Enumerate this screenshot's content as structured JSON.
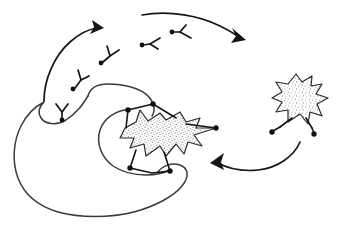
{
  "figure": {
    "background_color": "#ffffff",
    "ink_color": "#161616",
    "outline_color": "#3a3a3a",
    "stipple_color": "#8a8a8a",
    "width": 341,
    "height": 231
  },
  "shapes": {
    "amoeba": {
      "name": "large-amoeba-outline",
      "description": "large rounded closed outline with a notch at the top, occupying lower left",
      "stroke_color": "#3a3a3a"
    },
    "inner_arc": {
      "name": "inner-arc",
      "description": "curved arc inside the amoeba enclosing the central blob"
    },
    "center_blob": {
      "name": "center-stippled-blob",
      "description": "stippled star-shaped body with spikes, centre of image",
      "fill": "stipple"
    },
    "right_blob": {
      "name": "right-stippled-blob",
      "description": "stippled star-shaped body with spikes, right side of image",
      "fill": "stipple"
    }
  },
  "nodes": {
    "center": [
      {
        "name": "node-center-upper-left",
        "x": 128,
        "y": 110
      },
      {
        "name": "node-center-upper-right",
        "x": 153,
        "y": 104
      },
      {
        "name": "node-center-right-tip",
        "x": 216,
        "y": 128
      },
      {
        "name": "node-center-lower-left",
        "x": 130,
        "y": 168
      },
      {
        "name": "node-center-lower-right",
        "x": 170,
        "y": 171
      }
    ],
    "right": [
      {
        "name": "node-right-blob-left-foot",
        "x": 272,
        "y": 132
      },
      {
        "name": "node-right-blob-right-foot",
        "x": 314,
        "y": 134
      }
    ]
  },
  "fragments": [
    {
      "name": "y-fragment-on-amoeba-notch",
      "x": 62,
      "y": 118,
      "rotation": 0
    },
    {
      "name": "y-fragment-lower-left",
      "x": 74,
      "y": 87,
      "rotation": 25
    },
    {
      "name": "y-fragment-middle",
      "x": 102,
      "y": 62,
      "rotation": 20
    },
    {
      "name": "y-fragment-horizontal-left",
      "x": 143,
      "y": 46,
      "rotation": 95
    },
    {
      "name": "y-fragment-horizontal-right",
      "x": 173,
      "y": 33,
      "rotation": 100
    }
  ],
  "arrows": [
    {
      "name": "arrow-left-upward",
      "description": "curved arrow sweeping from lower left upward to the right",
      "head_x": 100,
      "head_y": 28,
      "direction": "up-right"
    },
    {
      "name": "arrow-top-rightward",
      "description": "curved arrow across the top sweeping right and down",
      "head_x": 243,
      "head_y": 37,
      "direction": "right-down"
    },
    {
      "name": "arrow-bottom-leftward",
      "description": "curved arrow from the right blob sweeping left toward the centre blob",
      "head_x": 213,
      "head_y": 162,
      "direction": "left"
    }
  ]
}
